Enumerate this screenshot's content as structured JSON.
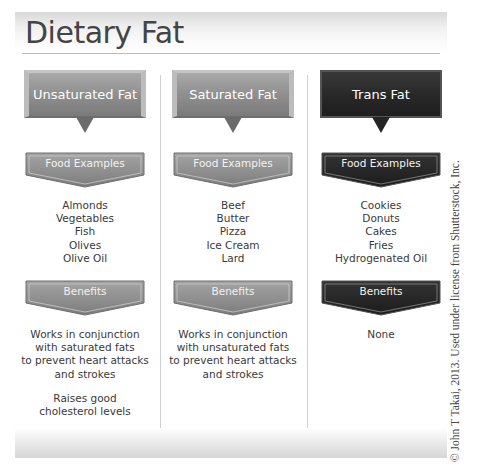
{
  "title": "Dietary Fat",
  "section_labels": {
    "food_examples": "Food Examples",
    "benefits": "Benefits"
  },
  "columns": [
    {
      "heading": "Unsaturated Fat",
      "style": "gray",
      "food_examples_label": "Food Examples",
      "foods": [
        "Almonds",
        "Vegetables",
        "Fish",
        "Olives",
        "Olive Oil"
      ],
      "benefits_label": "Benefits",
      "benefits": [
        [
          "Works in conjunction",
          "with saturated fats",
          "to prevent heart attacks",
          "and strokes"
        ],
        [
          "Raises good",
          "cholesterol levels"
        ]
      ]
    },
    {
      "heading": "Saturated Fat",
      "style": "gray",
      "food_examples_label": "Food Examples",
      "foods": [
        "Beef",
        "Butter",
        "Pizza",
        "Ice Cream",
        "Lard"
      ],
      "benefits_label": "Benefits",
      "benefits": [
        [
          "Works in conjunction",
          "with unsaturated fats",
          "to prevent heart attacks",
          "and strokes"
        ]
      ]
    },
    {
      "heading": "Trans Fat",
      "style": "dark",
      "food_examples_label": "Food Examples",
      "foods": [
        "Cookies",
        "Donuts",
        "Cakes",
        "Fries",
        "Hydrogenated Oil"
      ],
      "benefits_label": "Benefits",
      "benefits": [
        [
          "None"
        ]
      ]
    }
  ],
  "copyright": "© John T Takai, 2013. Used under license from Shutterstock, Inc.",
  "colors": {
    "gray_fill": "#8f8f8f",
    "dark_fill": "#262626",
    "text": "#3a3a3a"
  }
}
